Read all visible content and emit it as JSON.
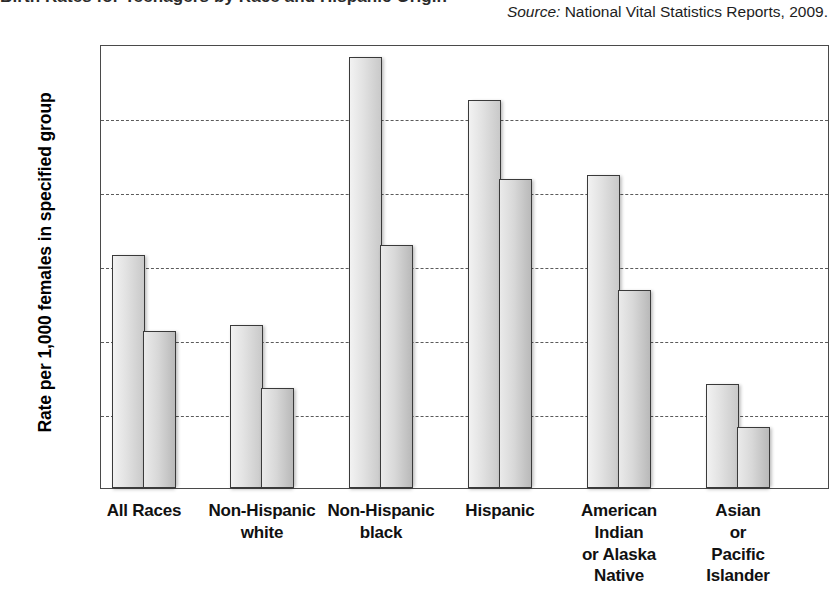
{
  "title_remnant": "Birth Rates for Teenagers by Race and Hispanic Origin",
  "source": {
    "label": "Source:",
    "text": "National Vital Statistics Reports, 2009."
  },
  "chart_data": {
    "type": "bar",
    "title": "",
    "xlabel": "",
    "ylabel": "Rate per 1,000 females in specified group",
    "ylim": [
      0,
      120
    ],
    "yticks": [
      0,
      20,
      40,
      60,
      80,
      100,
      120
    ],
    "grid": true,
    "legend": "none",
    "categories": [
      "All Races",
      "Non-Hispanic white",
      "Non-Hispanic black",
      "Hispanic",
      "American Indian or Alaska Native",
      "Asian or Pacific Islander"
    ],
    "category_lines": [
      [
        "All Races"
      ],
      [
        "Non-Hispanic",
        "white"
      ],
      [
        "Non-Hispanic",
        "black"
      ],
      [
        "Hispanic"
      ],
      [
        "American",
        "Indian",
        "or Alaska",
        "Native"
      ],
      [
        "Asian",
        "or",
        "Pacific",
        "Islander"
      ]
    ],
    "series": [
      {
        "name": "Series 1",
        "values": [
          63,
          44,
          116.5,
          105,
          84.5,
          28
        ]
      },
      {
        "name": "Series 2",
        "values": [
          42.5,
          27,
          65.8,
          83.5,
          53.5,
          16.5
        ]
      }
    ]
  },
  "colors": {
    "axis": "#4a4a4a",
    "gridline": "#5b5b5b",
    "bar_series_1": "#e2e2e2",
    "bar_series_2": "#d8d8d8",
    "bar_outline": "#3a3a3a",
    "text": "#000000"
  }
}
